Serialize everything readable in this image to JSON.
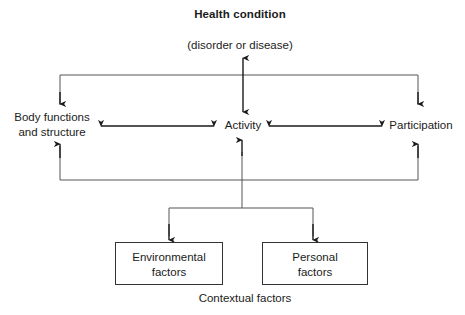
{
  "diagram": {
    "title": "Health condition",
    "subtitle": "(disorder or disease)",
    "nodes": {
      "health_condition": "Health condition",
      "health_condition_sub": "(disorder or disease)",
      "body_functions": "Body functions\nand structure",
      "activity": "Activity",
      "participation": "Participation",
      "environmental_factors": "Environmental\nfactors",
      "personal_factors": "Personal\nfactors"
    },
    "group_label": "Contextual factors",
    "colors": {
      "background": "#ffffff",
      "text": "#1a1a1a",
      "arrow": "#1a1a1a",
      "connector": "#555555",
      "box_stroke": "#333333"
    }
  }
}
